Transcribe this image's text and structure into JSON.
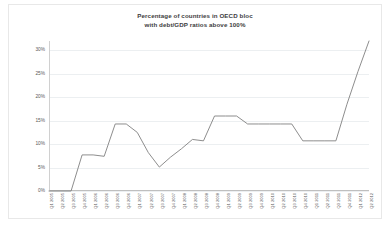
{
  "chart_data": {
    "type": "line",
    "title": "Percentage of countries in OECD bloc with debt/GDP ratios above 100%",
    "title_line1": "Percentage of countries in OECD bloc",
    "title_line2": "with debt/GDP ratios above 100%",
    "xlabel": "",
    "ylabel": "",
    "ylim": [
      0,
      32
    ],
    "grid": true,
    "legend": "none",
    "line_color": "#808080",
    "ytick_labels": [
      "30%",
      "25%",
      "20%",
      "15%",
      "10%",
      "5%",
      "0%"
    ],
    "ytick_values": [
      30,
      25,
      20,
      15,
      10,
      5,
      0
    ],
    "categories": [
      "Q1 2005",
      "Q2 2005",
      "Q3 2005",
      "Q4 2005",
      "Q1 2006",
      "Q2 2006",
      "Q3 2006",
      "Q4 2006",
      "Q1 2007",
      "Q2 2007",
      "Q3 2007",
      "Q4 2007",
      "Q1 2008",
      "Q2 2008",
      "Q3 2008",
      "Q4 2008",
      "Q1 2009",
      "Q2 2009",
      "Q3 2009",
      "Q4 2009",
      "Q1 2010",
      "Q2 2010",
      "Q3 2010",
      "Q4 2010",
      "Q1 2011",
      "Q2 2011",
      "Q3 2011",
      "Q4 2011",
      "Q1 2012",
      "Q2 2012"
    ],
    "values": [
      0,
      0,
      0,
      7.7,
      7.7,
      7.4,
      14.3,
      14.3,
      12.5,
      8.2,
      5.1,
      7.2,
      9.0,
      11.0,
      10.7,
      16.0,
      16.0,
      16.0,
      14.3,
      14.3,
      14.3,
      14.3,
      14.3,
      10.7,
      10.7,
      10.7,
      10.7,
      18.5,
      25.5,
      32.0
    ]
  }
}
